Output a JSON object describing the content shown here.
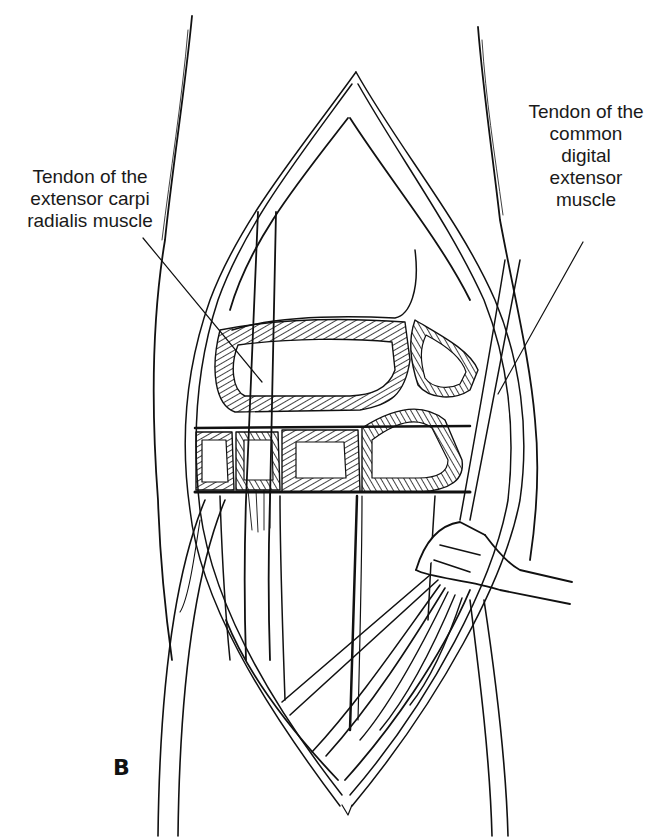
{
  "figure": {
    "panel_letter": "B",
    "line_color": "#111111",
    "background": "#ffffff"
  },
  "labels": {
    "left": {
      "lines": [
        "Tendon of the",
        "extensor carpi",
        "radialis muscle"
      ],
      "points_to": "vertical tendon crossing carpal bones"
    },
    "right": {
      "lines": [
        "Tendon of the",
        "common",
        "digital",
        "extensor",
        "muscle"
      ],
      "points_to": "retracted tendon bundle on right side"
    }
  },
  "instruments": [
    {
      "name": "retractor",
      "position": "lower right, holding tendons"
    }
  ]
}
